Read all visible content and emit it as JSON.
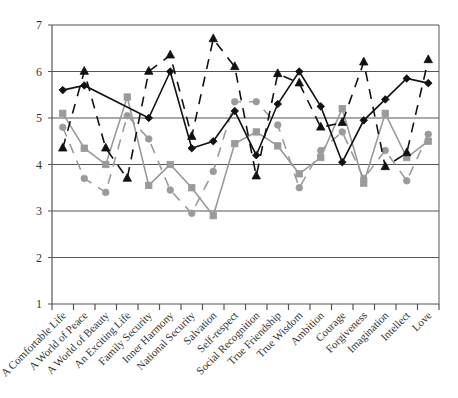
{
  "chart_data": {
    "type": "line",
    "title": "",
    "xlabel": "",
    "ylabel": "",
    "ylim": [
      1,
      7
    ],
    "yticks": [
      1,
      2,
      3,
      4,
      5,
      6,
      7
    ],
    "grid": true,
    "legend": null,
    "categories": [
      "A Comfortable Life",
      "A World of Peace",
      "A World of Beauty",
      "An Exciting Life",
      "Family Security",
      "Inner Harmony",
      "National Security",
      "Salvation",
      "Self-respect",
      "Social Recognition",
      "True Friendship",
      "True Wisdom",
      "Ambition",
      "Courage",
      "Forgiveness",
      "Imagination",
      "Intellect",
      "Love"
    ],
    "series": [
      {
        "name": "Series 1",
        "color": "#111111",
        "line_style": "solid",
        "marker": "diamond",
        "values": [
          5.6,
          5.7,
          null,
          null,
          5.0,
          6.0,
          4.35,
          4.5,
          5.15,
          4.2,
          5.3,
          6.0,
          5.25,
          4.05,
          4.95,
          5.4,
          5.85,
          5.75
        ]
      },
      {
        "name": "Series 2",
        "color": "#111111",
        "line_style": "dashed",
        "marker": "triangle",
        "values": [
          4.35,
          6.0,
          4.35,
          3.7,
          6.0,
          6.35,
          4.6,
          6.7,
          6.1,
          3.75,
          5.95,
          5.75,
          4.8,
          4.9,
          6.2,
          3.95,
          4.25,
          6.25
        ]
      },
      {
        "name": "Series 3",
        "color": "#9a9a9a",
        "line_style": "solid",
        "marker": "square",
        "values": [
          5.1,
          4.35,
          4.0,
          5.45,
          3.55,
          4.0,
          3.5,
          2.9,
          4.45,
          4.7,
          4.4,
          3.8,
          4.15,
          5.2,
          3.6,
          5.1,
          4.15,
          4.5
        ]
      },
      {
        "name": "Series 4",
        "color": "#9a9a9a",
        "line_style": "dashed",
        "marker": "circle",
        "values": [
          4.8,
          3.7,
          3.4,
          5.05,
          4.55,
          3.45,
          2.95,
          3.85,
          5.35,
          5.35,
          4.85,
          3.5,
          4.3,
          4.7,
          3.7,
          4.3,
          3.65,
          4.65
        ]
      }
    ]
  },
  "layout": {
    "plot_left": 52,
    "plot_right": 439,
    "plot_top": 25,
    "plot_bottom": 304
  }
}
